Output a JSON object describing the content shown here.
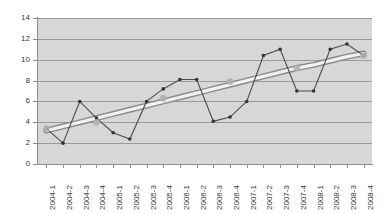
{
  "chart_data": {
    "type": "line",
    "title": "",
    "subtitle": "",
    "xlabel": "",
    "ylabel": "",
    "ylim": [
      0,
      14
    ],
    "ytick_values": [
      0,
      2,
      4,
      6,
      8,
      10,
      12,
      14
    ],
    "ytick_labels": [
      "0",
      "2",
      "4",
      "6",
      "8",
      "10",
      "12",
      "14"
    ],
    "grid": true,
    "legend": "none",
    "plot_background_color": "#d7d7d7",
    "gridline_color": "#9a9a9a",
    "series_color": "#4d4d4d",
    "trendline_color": "#f2f2f2",
    "trendline_shadow_color": "#8a8a8a",
    "marker_color": "#333333",
    "highlight_marker_color": "#b0b0b0",
    "categories": [
      "2004-1",
      "2004-2",
      "2004-3",
      "2004-4",
      "2005-1",
      "2005-2",
      "2005-3",
      "2005-4",
      "2006-1",
      "2006-2",
      "2006-3",
      "2006-4",
      "2007-1",
      "2007-2",
      "2007-3",
      "2007-4",
      "2008-1",
      "2008-2",
      "2008-3",
      "2008-4"
    ],
    "series": [
      {
        "name": "value",
        "values": [
          3.4,
          2.0,
          6.0,
          4.4,
          3.0,
          2.4,
          6.0,
          7.2,
          8.1,
          8.1,
          4.1,
          4.5,
          6.0,
          10.4,
          11.0,
          7.0,
          7.0,
          11.0,
          11.5,
          10.4
        ]
      },
      {
        "name": "trendline",
        "values": [
          3.2,
          3.6,
          4.0,
          4.4,
          4.8,
          5.2,
          5.6,
          6.0,
          6.4,
          6.8,
          7.2,
          7.6,
          8.0,
          8.4,
          8.8,
          9.2,
          9.5,
          9.9,
          10.3,
          10.6
        ]
      }
    ],
    "highlight_points": [
      {
        "index": 0,
        "value": 3.4
      },
      {
        "index": 3,
        "value": 4.0
      },
      {
        "index": 7,
        "value": 6.3
      },
      {
        "index": 11,
        "value": 7.9
      },
      {
        "index": 15,
        "value": 9.2
      },
      {
        "index": 19,
        "value": 10.4
      }
    ]
  }
}
